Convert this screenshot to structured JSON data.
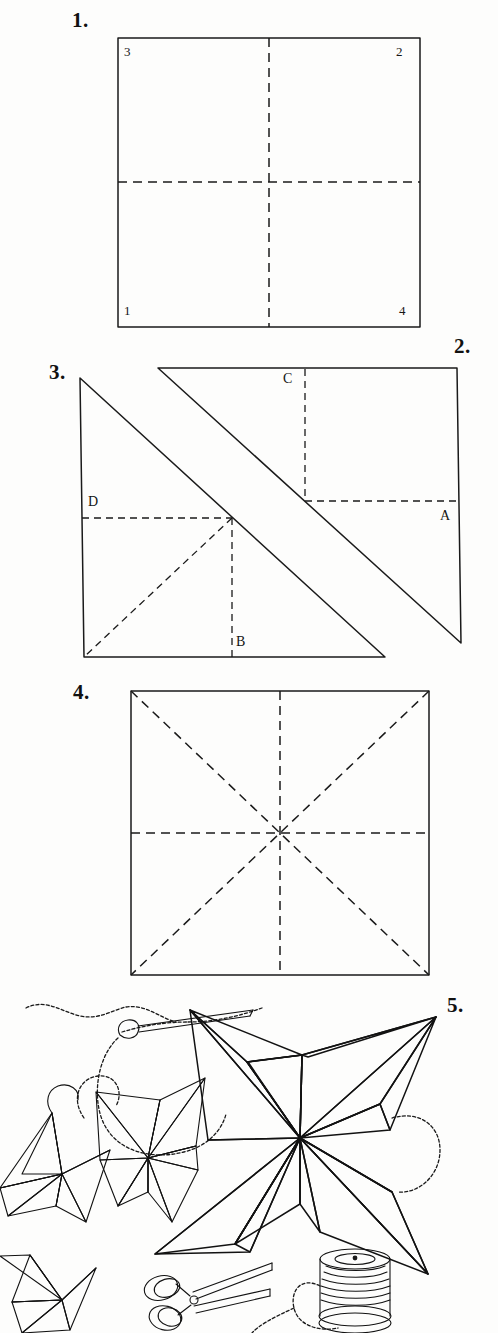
{
  "document": {
    "title": "Folded Paper Star — Step-by-Step Diagram",
    "kind": "hand-drawn instructional illustration",
    "ink_color": "#1a1a1a",
    "paper_color": "#fdfdfc"
  },
  "steps": [
    {
      "id": "step-1",
      "number": "1.",
      "figure": "square with vertical and horizontal dashed centre folds",
      "corner_labels": [
        {
          "name": "corner-3",
          "text": "3",
          "position": "top-left"
        },
        {
          "name": "corner-2",
          "text": "2",
          "position": "top-right"
        },
        {
          "name": "corner-1",
          "text": "1",
          "position": "bottom-left"
        },
        {
          "name": "corner-4",
          "text": "4",
          "position": "bottom-right"
        }
      ]
    },
    {
      "id": "step-2",
      "number": "2.",
      "figure": "upper-right folded triangle",
      "point_labels": [
        {
          "name": "point-c",
          "text": "C"
        },
        {
          "name": "point-a",
          "text": "A"
        }
      ]
    },
    {
      "id": "step-3",
      "number": "3.",
      "figure": "lower-left folded triangle with dashed creases",
      "point_labels": [
        {
          "name": "point-d",
          "text": "D"
        },
        {
          "name": "point-b",
          "text": "B"
        }
      ]
    },
    {
      "id": "step-4",
      "number": "4.",
      "figure": "square showing all eight dashed fold lines (both diagonals plus vertical and horizontal centre lines)"
    },
    {
      "id": "step-5",
      "number": "5.",
      "figure": "finished four-point paper stars with sewing needle, thread, scissors and spool",
      "objects": [
        {
          "name": "large-paper-star",
          "label": ""
        },
        {
          "name": "small-paper-star-left",
          "label": ""
        },
        {
          "name": "small-paper-star-far-left",
          "label": ""
        },
        {
          "name": "sewing-needle",
          "label": ""
        },
        {
          "name": "thread",
          "label": ""
        },
        {
          "name": "scissors",
          "label": ""
        },
        {
          "name": "thread-spool",
          "label": ""
        }
      ]
    }
  ]
}
